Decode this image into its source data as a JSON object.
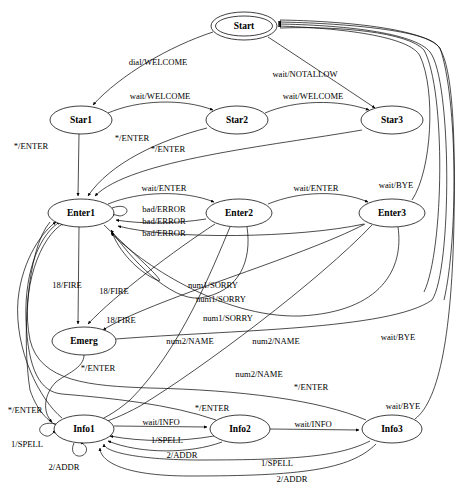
{
  "diagram": {
    "title": "",
    "type": "finite-state-machine",
    "background_color": "#ffffff",
    "line_color": "#000000",
    "nodes": [
      {
        "id": "Start",
        "label": "Start",
        "shape": "doublecircle",
        "cx": 244,
        "cy": 26,
        "rx": 33,
        "ry": 14
      },
      {
        "id": "Star1",
        "label": "Star1",
        "shape": "ellipse",
        "cx": 81,
        "cy": 120,
        "rx": 31,
        "ry": 14
      },
      {
        "id": "Star2",
        "label": "Star2",
        "shape": "ellipse",
        "cx": 237,
        "cy": 120,
        "rx": 31,
        "ry": 14
      },
      {
        "id": "Star3",
        "label": "Star3",
        "shape": "ellipse",
        "cx": 392,
        "cy": 120,
        "rx": 31,
        "ry": 14
      },
      {
        "id": "Enter1",
        "label": "Enter1",
        "shape": "ellipse",
        "cx": 81,
        "cy": 213,
        "rx": 33,
        "ry": 14
      },
      {
        "id": "Enter2",
        "label": "Enter2",
        "shape": "ellipse",
        "cx": 239,
        "cy": 213,
        "rx": 33,
        "ry": 14
      },
      {
        "id": "Enter3",
        "label": "Enter3",
        "shape": "ellipse",
        "cx": 392,
        "cy": 213,
        "rx": 33,
        "ry": 14
      },
      {
        "id": "Emerg",
        "label": "Emerg",
        "shape": "ellipse",
        "cx": 84,
        "cy": 341,
        "rx": 32,
        "ry": 14
      },
      {
        "id": "Info1",
        "label": "Info1",
        "shape": "ellipse",
        "cx": 84,
        "cy": 429,
        "rx": 30,
        "ry": 14
      },
      {
        "id": "Info2",
        "label": "Info2",
        "shape": "ellipse",
        "cx": 240,
        "cy": 429,
        "rx": 30,
        "ry": 14
      },
      {
        "id": "Info3",
        "label": "Info3",
        "shape": "ellipse",
        "cx": 392,
        "cy": 429,
        "rx": 30,
        "ry": 14
      }
    ],
    "edge_labels": [
      {
        "text": "dial/WELCOME",
        "x": 158,
        "y": 62
      },
      {
        "text": "wait/NOTALLOW",
        "x": 305,
        "y": 74
      },
      {
        "text": "wait/WELCOME",
        "x": 160,
        "y": 96
      },
      {
        "text": "wait/WELCOME",
        "x": 313,
        "y": 96
      },
      {
        "text": "*/ENTER",
        "x": 31,
        "y": 146
      },
      {
        "text": "*/ENTER",
        "x": 132,
        "y": 138
      },
      {
        "text": "*/ENTER",
        "x": 168,
        "y": 149
      },
      {
        "text": "wait/ENTER",
        "x": 164,
        "y": 188
      },
      {
        "text": "wait/ENTER",
        "x": 316,
        "y": 188
      },
      {
        "text": "wait/BYE",
        "x": 396,
        "y": 185
      },
      {
        "text": "bad/ERROR",
        "x": 164,
        "y": 209
      },
      {
        "text": "bad/ERROR",
        "x": 164,
        "y": 221
      },
      {
        "text": "bad/ERROR",
        "x": 164,
        "y": 233
      },
      {
        "text": "18/FIRE",
        "x": 67,
        "y": 285
      },
      {
        "text": "18/FIRE",
        "x": 114,
        "y": 291
      },
      {
        "text": "18/FIRE",
        "x": 121,
        "y": 320
      },
      {
        "text": "num1/SORRY",
        "x": 213,
        "y": 285
      },
      {
        "text": "num1/SORRY",
        "x": 221,
        "y": 299
      },
      {
        "text": "num1/SORRY",
        "x": 228,
        "y": 318
      },
      {
        "text": "wait/BYE",
        "x": 398,
        "y": 337
      },
      {
        "text": "num2/NAME",
        "x": 190,
        "y": 341
      },
      {
        "text": "num2/NAME",
        "x": 276,
        "y": 341
      },
      {
        "text": "*/ENTER",
        "x": 98,
        "y": 368
      },
      {
        "text": "num2/NAME",
        "x": 259,
        "y": 374
      },
      {
        "text": "*/ENTER",
        "x": 311,
        "y": 387
      },
      {
        "text": "*/ENTER",
        "x": 25,
        "y": 410
      },
      {
        "text": "*/ENTER",
        "x": 212,
        "y": 408
      },
      {
        "text": "wait/BYE",
        "x": 403,
        "y": 406
      },
      {
        "text": "wait/INFO",
        "x": 161,
        "y": 422
      },
      {
        "text": "wait/INFO",
        "x": 313,
        "y": 424
      },
      {
        "text": "1/SPELL",
        "x": 27,
        "y": 444
      },
      {
        "text": "1/SPELL",
        "x": 167,
        "y": 440
      },
      {
        "text": "2/ADDR",
        "x": 64,
        "y": 467
      },
      {
        "text": "2/ADDR",
        "x": 182,
        "y": 455
      },
      {
        "text": "1/SPELL",
        "x": 277,
        "y": 463
      },
      {
        "text": "2/ADDR",
        "x": 292,
        "y": 479
      }
    ],
    "transitions": [
      {
        "from": "Start",
        "to": "Star1",
        "label": "dial/WELCOME"
      },
      {
        "from": "Start",
        "to": "Star3",
        "label": "wait/NOTALLOW"
      },
      {
        "from": "Star1",
        "to": "Star2",
        "label": "wait/WELCOME"
      },
      {
        "from": "Star2",
        "to": "Star3",
        "label": "wait/WELCOME"
      },
      {
        "from": "Star1",
        "to": "Enter1",
        "label": "*/ENTER"
      },
      {
        "from": "Star2",
        "to": "Enter1",
        "label": "*/ENTER"
      },
      {
        "from": "Star3",
        "to": "Enter1",
        "label": "*/ENTER"
      },
      {
        "from": "Enter1",
        "to": "Enter2",
        "label": "wait/ENTER"
      },
      {
        "from": "Enter2",
        "to": "Enter3",
        "label": "wait/ENTER"
      },
      {
        "from": "Enter3",
        "to": "Start",
        "label": "wait/BYE"
      },
      {
        "from": "Enter1",
        "to": "Enter1",
        "label": "bad/ERROR"
      },
      {
        "from": "Enter2",
        "to": "Enter1",
        "label": "bad/ERROR"
      },
      {
        "from": "Enter3",
        "to": "Enter1",
        "label": "bad/ERROR"
      },
      {
        "from": "Enter1",
        "to": "Emerg",
        "label": "18/FIRE"
      },
      {
        "from": "Enter2",
        "to": "Emerg",
        "label": "18/FIRE"
      },
      {
        "from": "Enter3",
        "to": "Emerg",
        "label": "18/FIRE"
      },
      {
        "from": "Enter1",
        "to": "Enter1",
        "label": "num1/SORRY"
      },
      {
        "from": "Enter2",
        "to": "Enter1",
        "label": "num1/SORRY"
      },
      {
        "from": "Enter3",
        "to": "Enter1",
        "label": "num1/SORRY"
      },
      {
        "from": "Enter1",
        "to": "Info1",
        "label": "num2/NAME"
      },
      {
        "from": "Enter2",
        "to": "Info1",
        "label": "num2/NAME"
      },
      {
        "from": "Enter3",
        "to": "Info1",
        "label": "num2/NAME"
      },
      {
        "from": "Emerg",
        "to": "Info1",
        "label": "*/ENTER"
      },
      {
        "from": "Emerg",
        "to": "Start",
        "label": "wait/BYE"
      },
      {
        "from": "Info1",
        "to": "Enter1",
        "label": "*/ENTER"
      },
      {
        "from": "Info2",
        "to": "Enter1",
        "label": "*/ENTER"
      },
      {
        "from": "Info3",
        "to": "Enter1",
        "label": "*/ENTER"
      },
      {
        "from": "Info1",
        "to": "Info2",
        "label": "wait/INFO"
      },
      {
        "from": "Info2",
        "to": "Info3",
        "label": "wait/INFO"
      },
      {
        "from": "Info3",
        "to": "Start",
        "label": "wait/BYE"
      },
      {
        "from": "Info1",
        "to": "Info1",
        "label": "1/SPELL"
      },
      {
        "from": "Info1",
        "to": "Info1",
        "label": "2/ADDR"
      },
      {
        "from": "Info2",
        "to": "Info1",
        "label": "1/SPELL"
      },
      {
        "from": "Info2",
        "to": "Info1",
        "label": "2/ADDR"
      },
      {
        "from": "Info3",
        "to": "Info1",
        "label": "1/SPELL"
      },
      {
        "from": "Info3",
        "to": "Info1",
        "label": "2/ADDR"
      }
    ]
  }
}
